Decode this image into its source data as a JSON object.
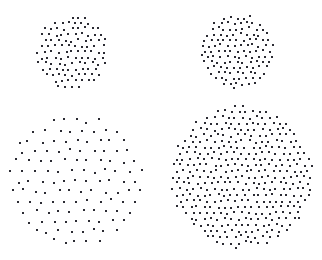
{
  "canvas": {
    "width": 322,
    "height": 260,
    "background_color": "#ffffff",
    "dot_color": "#2b2b33",
    "dot_size_px": 2,
    "dot_shape": "square"
  },
  "stimulus": {
    "name": "four-dot-array-comparison",
    "description": "Four circular arrays of small dark dots arranged in a two-by-two layout on a white field, differing in array radius and dot density."
  },
  "chart_data": {
    "type": "scatter",
    "title": "",
    "xlabel": "",
    "ylabel": "",
    "grid": false,
    "legend": false,
    "xlim": [
      0,
      322
    ],
    "ylim": [
      0,
      260
    ],
    "y_axis_inverted": true,
    "marker": {
      "shape": "square",
      "size_px": 2,
      "color": "#2b2b33"
    },
    "series": [
      {
        "name": "top-left-cluster",
        "quadrant": "top-left",
        "center_x": 72,
        "center_y": 52,
        "radius_px": 37,
        "lattice_spacing_px": 6.7,
        "jitter_px": 1.5,
        "dot_count": 120,
        "relative_density": "high",
        "relative_size": "small"
      },
      {
        "name": "top-right-cluster",
        "quadrant": "top-right",
        "center_x": 237,
        "center_y": 51,
        "radius_px": 38,
        "lattice_spacing_px": 6.4,
        "jitter_px": 1.5,
        "dot_count": 133,
        "relative_density": "high",
        "relative_size": "small"
      },
      {
        "name": "bottom-left-cluster",
        "quadrant": "bottom-left",
        "center_x": 76,
        "center_y": 181,
        "radius_px": 71,
        "lattice_spacing_px": 11.6,
        "jitter_px": 2.2,
        "dot_count": 122,
        "relative_density": "low",
        "relative_size": "large"
      },
      {
        "name": "bottom-right-cluster",
        "quadrant": "bottom-right",
        "center_x": 242,
        "center_y": 177,
        "radius_px": 72,
        "lattice_spacing_px": 6.9,
        "jitter_px": 1.4,
        "dot_count": 420,
        "relative_density": "very-high",
        "relative_size": "large"
      }
    ]
  }
}
